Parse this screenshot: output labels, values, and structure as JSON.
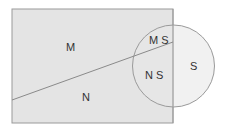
{
  "diagram": {
    "regions": {
      "m": "M",
      "n": "N",
      "ms": "M S",
      "ns": "N S",
      "s": "S"
    },
    "colors": {
      "fill": "#e4e4e4",
      "stroke": "#9a9a9a",
      "background": "#ffffff",
      "text": "#333333"
    }
  }
}
